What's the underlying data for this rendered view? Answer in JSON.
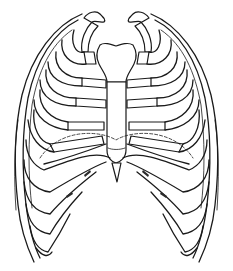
{
  "image": {
    "subject": "rib-cage-illustration",
    "style": "black line art on white",
    "colors": {
      "line": "#1a1a1a",
      "background": "#ffffff"
    }
  }
}
